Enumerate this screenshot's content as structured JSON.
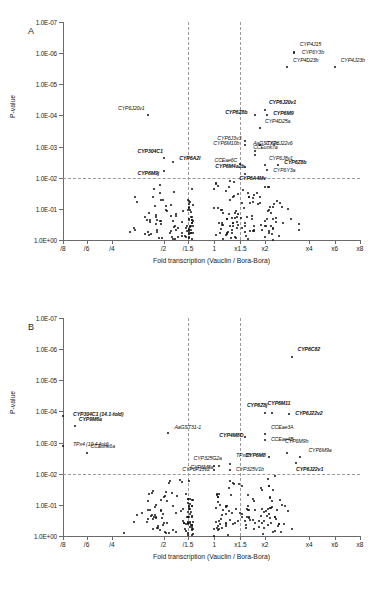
{
  "figure": {
    "panels": [
      {
        "letter": "A",
        "axis": {
          "ylabel": "P-value",
          "xlabel": "Fold transcription  (Vauclin / Bora-Bora)",
          "yticks": [
            "1.0E-07",
            "1.0E-06",
            "1.0E-05",
            "1.0E-04",
            "1.0E-03",
            "1.0E-02",
            "1.0E-01",
            "1.0E+00"
          ],
          "xticks": [
            "/8",
            "/6",
            "/4",
            "/2",
            "/1.5",
            "1",
            "x1.5",
            "x2",
            "x4",
            "x6",
            "x8"
          ],
          "threshold_p": "1.0E-02",
          "threshold_fold_down": "/1.5",
          "threshold_fold_up": "x1.5"
        },
        "labels": [
          {
            "t": "CYP4J15",
            "bold": false
          },
          {
            "t": "CYP6Y3b",
            "bold": false
          },
          {
            "t": "CYP4D23b",
            "bold": false
          },
          {
            "t": "CYP4J23b",
            "bold": false
          },
          {
            "t": "CYP6J20v1",
            "bold": true
          },
          {
            "t": "CYP6Z8b",
            "bold": true
          },
          {
            "t": "CYP6M9",
            "bold": true
          },
          {
            "t": "CYP4D25a",
            "bold": false
          },
          {
            "t": "CYP6J3v3",
            "bold": false
          },
          {
            "t": "CYP6M10b",
            "bold": false
          },
          {
            "t": "CYP6J22v6",
            "bold": false
          },
          {
            "t": "AaGSTX2c",
            "bold": false
          },
          {
            "t": "CCEunk7a",
            "bold": false
          },
          {
            "t": "CCEae6C",
            "bold": false
          },
          {
            "t": "CYP6J8v1",
            "bold": false
          },
          {
            "t": "CYP6M4a2b",
            "bold": true
          },
          {
            "t": "CYP6Y3a",
            "bold": false
          },
          {
            "t": "CYP6Z8b",
            "bold": true
          },
          {
            "t": "CYP6A4Mv",
            "bold": true
          },
          {
            "t": "CYP6J20v1",
            "bold": false
          },
          {
            "t": "CYP304C1",
            "bold": true
          },
          {
            "t": "CYP6A2l",
            "bold": true
          },
          {
            "t": "CYP6M9j",
            "bold": true
          }
        ]
      },
      {
        "letter": "B",
        "axis": {
          "ylabel": "P-value",
          "xlabel": "Fold transcription  (Vauclin / Bora-Bora)",
          "yticks": [
            "1.0E-07",
            "1.0E-06",
            "1.0E-05",
            "1.0E-04",
            "1.0E-03",
            "1.0E-02",
            "1.0E-01",
            "1.0E+00"
          ],
          "xticks": [
            "/8",
            "/6",
            "/4",
            "/2",
            "/1.5",
            "1",
            "x1.5",
            "x2",
            "x4",
            "x6",
            "x8"
          ],
          "threshold_p": "1.0E-02",
          "threshold_fold_down": "/1.5",
          "threshold_fold_up": "x1.5"
        },
        "labels": [
          {
            "t": "CYP6C82",
            "bold": true
          },
          {
            "t": "CYP6Z8j",
            "bold": true
          },
          {
            "t": "CYP6M11",
            "bold": true
          },
          {
            "t": "CYP6J22v2",
            "bold": true
          },
          {
            "t": "CYP304C1 (14.1-fold)",
            "bold": true
          },
          {
            "t": "CYP9M6a",
            "bold": true
          },
          {
            "t": "AaGST31-1",
            "bold": false
          },
          {
            "t": "CYP4M8D",
            "bold": true
          },
          {
            "t": "CCEae3A",
            "bold": false
          },
          {
            "t": "CCEae4B",
            "bold": false
          },
          {
            "t": "TPx4 (10.4-fold)",
            "bold": false
          },
          {
            "t": "CCEunk6a",
            "bold": false
          },
          {
            "t": "CYP325G2a",
            "bold": false
          },
          {
            "t": "TPx38",
            "bold": false
          },
          {
            "t": "CYP6P13v2",
            "bold": false
          },
          {
            "t": "CYP325V1b",
            "bold": false
          },
          {
            "t": "CYP6M8",
            "bold": true
          },
          {
            "t": "CYP6M9b",
            "bold": false
          },
          {
            "t": "CYP6M9a",
            "bold": false
          },
          {
            "t": "CYP6J22v1",
            "bold": true
          },
          {
            "t": "CYP6M8a",
            "bold": false
          }
        ]
      }
    ]
  },
  "chart_data": [
    {
      "type": "scatter",
      "panel": "A",
      "title": "",
      "xlabel": "Fold transcription  (Vauclin / Bora-Bora)",
      "ylabel": "P-value",
      "xscale": "log2-fold",
      "yscale": "log-reversed",
      "ylim": [
        "1.0E-07",
        "1.0E+00"
      ],
      "xtick_labels": [
        "/8",
        "/6",
        "/4",
        "/2",
        "/1.5",
        "1",
        "x1.5",
        "x2",
        "x4",
        "x6",
        "x8"
      ],
      "xtick_fold": [
        -8,
        -6,
        -4,
        -2,
        -1.5,
        1,
        1.5,
        2,
        4,
        6,
        8
      ],
      "ytick_labels": [
        "1.0E-07",
        "1.0E-06",
        "1.0E-05",
        "1.0E-04",
        "1.0E-03",
        "1.0E-02",
        "1.0E-01",
        "1.0E+00"
      ],
      "grid": "dashed threshold lines at p=1.0E-02, fold=/1.5 and fold=x1.5",
      "annotated_points": [
        {
          "name": "CYP4J15",
          "fold": "x3.3",
          "p": "9.5E-07",
          "bold": false
        },
        {
          "name": "CYP6Y3b",
          "fold": "x3.3",
          "p": "1.0E-06",
          "bold": false
        },
        {
          "name": "CYP4D23b",
          "fold": "x3.0",
          "p": "2.8E-06",
          "bold": false
        },
        {
          "name": "CYP4J23b",
          "fold": "x6.0",
          "p": "2.8E-06",
          "bold": false
        },
        {
          "name": "CYP6J20v1",
          "fold": "x2.0",
          "p": "6.5E-05",
          "bold": true
        },
        {
          "name": "CYP6Z8b",
          "fold": "x1.8",
          "p": "1.0E-04",
          "bold": true
        },
        {
          "name": "CYP6M9",
          "fold": "x2.1",
          "p": "1.0E-04",
          "bold": true
        },
        {
          "name": "CYP4D25a",
          "fold": "x1.9",
          "p": "2.6E-04",
          "bold": false
        },
        {
          "name": "CYP6J3v3",
          "fold": "x1.6",
          "p": "6.5E-04",
          "bold": false
        },
        {
          "name": "CYP6M10b",
          "fold": "x1.6",
          "p": "9.0E-04",
          "bold": false
        },
        {
          "name": "CYP6J22v6",
          "fold": "x1.9",
          "p": "9.0E-04",
          "bold": false
        },
        {
          "name": "AaGSTX2c",
          "fold": "x1.8",
          "p": "1.4E-03",
          "bold": false
        },
        {
          "name": "CCEunk7a",
          "fold": "x1.8",
          "p": "1.9E-03",
          "bold": false
        },
        {
          "name": "CCEae6C",
          "fold": "x1.5",
          "p": "3.5E-03",
          "bold": false
        },
        {
          "name": "CYP6J8v1",
          "fold": "x2.0",
          "p": "4.0E-03",
          "bold": false
        },
        {
          "name": "CYP6M4a2b",
          "fold": "x1.6",
          "p": "4.5E-03",
          "bold": true
        },
        {
          "name": "CYP6Y3a",
          "fold": "x2.1",
          "p": "5.5E-03",
          "bold": false
        },
        {
          "name": "CYP6Z8b",
          "fold": "x2.6",
          "p": "4.0E-03",
          "bold": true
        },
        {
          "name": "CYP6A4Mv",
          "fold": "x1.6",
          "p": "7.5E-03",
          "bold": true
        },
        {
          "name": "CYP6J20v1",
          "fold": "/2.6",
          "p": "1.0E-04",
          "bold": false
        },
        {
          "name": "CYP304C1",
          "fold": "/2.0",
          "p": "2.4E-03",
          "bold": true
        },
        {
          "name": "CYP6A2l",
          "fold": "/1.8",
          "p": "3.2E-03",
          "bold": true
        },
        {
          "name": "CYP6M9j",
          "fold": "/2.0",
          "p": "6.0E-03",
          "bold": true
        }
      ],
      "cloud_description": "~200 unlabeled points concentrated near fold=1 with p between 1.0E-02 and 1.0E+00"
    },
    {
      "type": "scatter",
      "panel": "B",
      "title": "",
      "xlabel": "Fold transcription  (Vauclin / Bora-Bora)",
      "ylabel": "P-value",
      "xscale": "log2-fold",
      "yscale": "log-reversed",
      "ylim": [
        "1.0E-07",
        "1.0E+00"
      ],
      "xtick_labels": [
        "/8",
        "/6",
        "/4",
        "/2",
        "/1.5",
        "1",
        "x1.5",
        "x2",
        "x4",
        "x6",
        "x8"
      ],
      "xtick_fold": [
        -8,
        -6,
        -4,
        -2,
        -1.5,
        1,
        1.5,
        2,
        4,
        6,
        8
      ],
      "ytick_labels": [
        "1.0E-07",
        "1.0E-06",
        "1.0E-05",
        "1.0E-04",
        "1.0E-03",
        "1.0E-02",
        "1.0E-01",
        "1.0E+00"
      ],
      "grid": "dashed threshold lines at p=1.0E-02, fold=/1.5 and fold=x1.5",
      "annotated_points": [
        {
          "name": "CYP6C82",
          "fold": "x3.2",
          "p": "1.8E-06",
          "bold": true
        },
        {
          "name": "CYP6Z8j",
          "fold": "x2.0",
          "p": "1.1E-04",
          "bold": true
        },
        {
          "name": "CYP6M11",
          "fold": "x2.3",
          "p": "1.1E-04",
          "bold": true
        },
        {
          "name": "CYP6J22v2",
          "fold": "x3.1",
          "p": "1.2E-04",
          "bold": true
        },
        {
          "name": "CYP304C1 (14.1-fold)",
          "fold": "/14.1",
          "p": "1.4E-04",
          "bold": true
        },
        {
          "name": "CYP9M6a",
          "fold": "/7.0",
          "p": "3.0E-04",
          "bold": true
        },
        {
          "name": "AaGST31-1",
          "fold": "/1.9",
          "p": "5.0E-04",
          "bold": false
        },
        {
          "name": "CYP4M8D",
          "fold": "x1.6",
          "p": "6.5E-04",
          "bold": true
        },
        {
          "name": "CCEae3A",
          "fold": "x2.0",
          "p": "5.5E-04",
          "bold": false
        },
        {
          "name": "CCEae4B",
          "fold": "x2.0",
          "p": "8.0E-04",
          "bold": false
        },
        {
          "name": "TPx4 (10.4-fold)",
          "fold": "/10.4",
          "p": "1.3E-03",
          "bold": false
        },
        {
          "name": "CCEunk6a",
          "fold": "/6.0",
          "p": "2.2E-03",
          "bold": false
        },
        {
          "name": "CYP325G2a",
          "fold": "x1.1",
          "p": "5.5E-03",
          "bold": false
        },
        {
          "name": "TPx38",
          "fold": "x1.3",
          "p": "5.0E-03",
          "bold": false
        },
        {
          "name": "CYP6P13v2",
          "fold": "x1.0",
          "p": "7.5E-03",
          "bold": false
        },
        {
          "name": "CYP325V1b",
          "fold": "x1.3",
          "p": "7.5E-03",
          "bold": false
        },
        {
          "name": "CYP6M8",
          "fold": "x2.2",
          "p": "3.0E-03",
          "bold": true
        },
        {
          "name": "CYP6M9b",
          "fold": "x3.0",
          "p": "2.2E-03",
          "bold": false
        },
        {
          "name": "CYP6M9a",
          "fold": "x3.6",
          "p": "3.0E-03",
          "bold": false
        },
        {
          "name": "CYP6J22v1",
          "fold": "x3.4",
          "p": "4.5E-03",
          "bold": true
        },
        {
          "name": "CYP6M8a",
          "fold": "x1.0",
          "p": "5.5E-03",
          "bold": false
        }
      ],
      "cloud_description": "~200 unlabeled points concentrated near fold=1 with p between 1.0E-02 and 1.0E+00"
    }
  ]
}
